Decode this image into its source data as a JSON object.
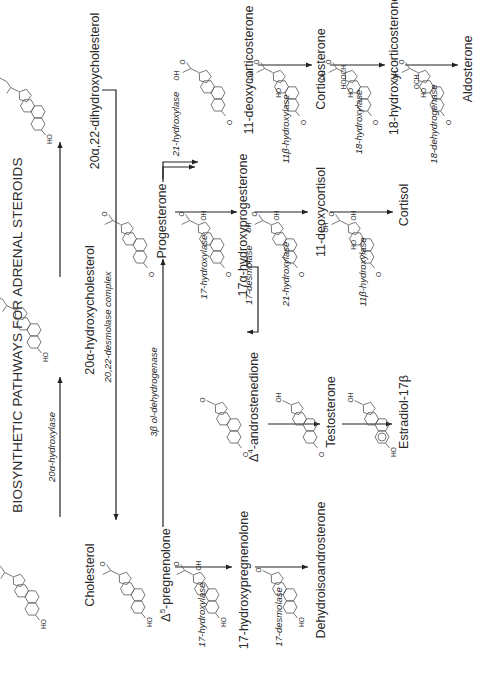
{
  "title": "BIOSYNTHETIC PATHWAYS FOR ADRENAL STEROIDS",
  "orientation": "rotated 90 degrees counter-clockwise",
  "compounds": [
    {
      "id": "cholesterol",
      "label": "Cholesterol"
    },
    {
      "id": "hydroxycholesterol",
      "label": "20α-hydroxycholesterol"
    },
    {
      "id": "dihydroxycholesterol",
      "label": "20α,22-dihydroxycholesterol"
    },
    {
      "id": "pregnenolone",
      "label": "Δ5-pregnenolone",
      "prefix": "Δ",
      "sup": "5",
      "rest": "-pregnenolone"
    },
    {
      "id": "hydroxypregnenolone",
      "label": "17-hydroxypregnenolone"
    },
    {
      "id": "dhea",
      "label": "Dehydroisoandrosterone"
    },
    {
      "id": "progesterone",
      "label": "Progesterone"
    },
    {
      "id": "hydroxyprogesterone",
      "label": "17α-hydroxyprogesterone"
    },
    {
      "id": "androstenedione",
      "label": "Δ4-androstenedione",
      "prefix": "Δ",
      "sup": "4",
      "rest": "-androstenedione"
    },
    {
      "id": "testosterone",
      "label": "Testosterone"
    },
    {
      "id": "estradiol",
      "label": "Estradiol-17β"
    },
    {
      "id": "deoxycorticosterone",
      "label": "11-deoxycorticosterone"
    },
    {
      "id": "corticosterone",
      "label": "Corticosterone"
    },
    {
      "id": "hydroxycorticosterone",
      "label": "18-hydroxycorticosterone"
    },
    {
      "id": "aldosterone",
      "label": "Aldosterone"
    },
    {
      "id": "deoxycortisol",
      "label": "11-deoxycortisol"
    },
    {
      "id": "cortisol",
      "label": "Cortisol"
    }
  ],
  "enzymes": [
    {
      "id": "e1",
      "label": "20α-hydroxylase",
      "from": "cholesterol",
      "to": "hydroxycholesterol"
    },
    {
      "id": "e2",
      "label": "20,22-desmolase complex",
      "from": "dihydroxycholesterol",
      "to": "pregnenolone"
    },
    {
      "id": "e3",
      "label": "3β ol-dehydrogenase",
      "from": "pregnenolone",
      "to": "progesterone"
    },
    {
      "id": "e4",
      "label": "17-hydroxylase",
      "from": "pregnenolone",
      "to": "hydroxypregnenolone"
    },
    {
      "id": "e5",
      "label": "17-desmolase",
      "from": "hydroxypregnenolone",
      "to": "dhea"
    },
    {
      "id": "e6",
      "label": "21-hydroxylase",
      "from": "progesterone",
      "to": "deoxycorticosterone"
    },
    {
      "id": "e7",
      "label": "17-hydroxylase",
      "from": "progesterone",
      "to": "hydroxyprogesterone"
    },
    {
      "id": "e8",
      "label": "17-desmolase",
      "from": "hydroxyprogesterone",
      "to": "androstenedione"
    },
    {
      "id": "e9",
      "label": "21-hydroxylase",
      "from": "hydroxyprogesterone",
      "to": "deoxycortisol"
    },
    {
      "id": "e10",
      "label": "11β-hydroxylase",
      "from": "deoxycortisol",
      "to": "cortisol"
    },
    {
      "id": "e11",
      "label": "11β-hydroxylase",
      "from": "deoxycorticosterone",
      "to": "corticosterone"
    },
    {
      "id": "e12",
      "label": "18-hydroxylase",
      "from": "corticosterone",
      "to": "hydroxycorticosterone"
    },
    {
      "id": "e13",
      "label": "18-dehydrogenase",
      "from": "hydroxycorticosterone",
      "to": "aldosterone"
    }
  ],
  "unlabeled_steps": [
    {
      "from": "hydroxycholesterol",
      "to": "dihydroxycholesterol"
    },
    {
      "from": "androstenedione",
      "to": "testosterone"
    },
    {
      "from": "testosterone",
      "to": "estradiol"
    }
  ],
  "atoms": {
    "ho": "HO",
    "oh": "OH",
    "o": "O",
    "hooch": "HOOCH",
    "och": "OCH"
  }
}
